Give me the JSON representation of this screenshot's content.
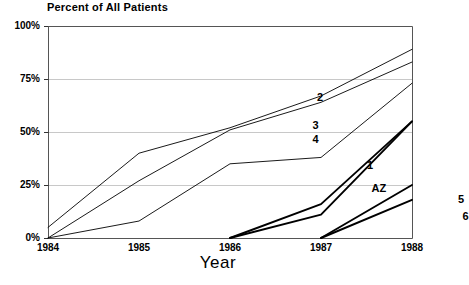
{
  "chart_data": {
    "type": "line",
    "title": "Percent of All Patients",
    "xlabel": "Year",
    "ylabel": "",
    "x": [
      1984,
      1985,
      1986,
      1987,
      1988
    ],
    "xlim": [
      1984,
      1988
    ],
    "ylim": [
      0,
      100
    ],
    "xticks": [
      "1984",
      "1985",
      "1986",
      "1987",
      "1988"
    ],
    "yticks": [
      "0%",
      "25%",
      "50%",
      "75%",
      "100%"
    ],
    "grid": "horizontal",
    "legend": "inline-labels",
    "series": [
      {
        "name": "2",
        "label": "2",
        "weight": "thin",
        "x": [
          1984,
          1985,
          1986,
          1987,
          1988
        ],
        "values": [
          5,
          40,
          52,
          67,
          89
        ]
      },
      {
        "name": "3",
        "label": "3",
        "weight": "thin",
        "x": [
          1984,
          1985,
          1986,
          1987,
          1988
        ],
        "values": [
          0,
          27,
          51,
          64,
          83
        ]
      },
      {
        "name": "4",
        "label": "4",
        "weight": "thin",
        "x": [
          1984,
          1985,
          1986,
          1987,
          1988
        ],
        "values": [
          0,
          8,
          35,
          38,
          73
        ]
      },
      {
        "name": "1",
        "label": "1",
        "weight": "thick",
        "x": [
          1986,
          1987,
          1988
        ],
        "values": [
          0,
          16,
          55
        ]
      },
      {
        "name": "AZ",
        "label": "AZ",
        "weight": "thick",
        "x": [
          1986,
          1987,
          1988
        ],
        "values": [
          0,
          11,
          55
        ]
      },
      {
        "name": "5",
        "label": "5",
        "weight": "thick",
        "x": [
          1987,
          1988
        ],
        "values": [
          0,
          25
        ]
      },
      {
        "name": "6",
        "label": "6",
        "weight": "thick",
        "x": [
          1987,
          1988
        ],
        "values": [
          0,
          18
        ]
      }
    ],
    "annotations": [
      {
        "text": "2",
        "x": 1987.0,
        "y": 66
      },
      {
        "text": "3",
        "x": 1986.95,
        "y": 53
      },
      {
        "text": "4",
        "x": 1986.95,
        "y": 46
      },
      {
        "text": "1",
        "x": 1987.55,
        "y": 34
      },
      {
        "text": "AZ",
        "x": 1987.6,
        "y": 23
      },
      {
        "text": "5",
        "x": 1988.55,
        "y": 18
      },
      {
        "text": "6",
        "x": 1988.6,
        "y": 10
      }
    ],
    "colors": {
      "line": "#000000",
      "grid": "#c8c8c8",
      "axis": "#555555",
      "background": "#ffffff",
      "text": "#000000"
    }
  }
}
